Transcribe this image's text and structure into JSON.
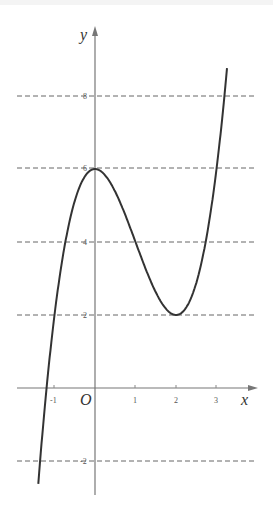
{
  "chart_data": {
    "type": "line",
    "title": "",
    "function": "y = x^3 - 3x^2 + 6",
    "xlabel": "x",
    "ylabel": "y",
    "origin_label": "O",
    "x_ticks": [
      -1,
      1,
      2,
      3
    ],
    "x_tick_labels": [
      "-1",
      "1",
      "2",
      "3"
    ],
    "y_ticks": [
      8,
      6,
      4,
      2,
      -2
    ],
    "y_tick_labels": [
      "8",
      "6",
      "4",
      "2",
      "-2"
    ],
    "dashed_horizontal_lines": [
      8,
      6,
      4,
      2,
      -2
    ],
    "xlim": [
      -1.8,
      4.0
    ],
    "ylim": [
      -3.0,
      9.5
    ],
    "key_points": [
      {
        "x": 0,
        "y": 6,
        "note": "local max"
      },
      {
        "x": 2,
        "y": 2,
        "note": "local min"
      }
    ],
    "series": [
      {
        "name": "f(x)",
        "x": [
          -1.45,
          -1.2,
          -1,
          -0.5,
          0,
          0.5,
          1,
          1.5,
          2,
          2.5,
          3,
          3.3
        ],
        "values": [
          -3.36,
          0.95,
          2,
          5.125,
          6,
          5.375,
          4,
          2.625,
          2,
          2.875,
          6,
          9.27
        ]
      }
    ],
    "grid": false,
    "legend": "none"
  },
  "labels": {
    "x_axis": "x",
    "y_axis": "y",
    "origin": "O",
    "xt": [
      "-1",
      "1",
      "2",
      "3"
    ],
    "yt": [
      "8",
      "6",
      "4",
      "2",
      "-2"
    ]
  }
}
